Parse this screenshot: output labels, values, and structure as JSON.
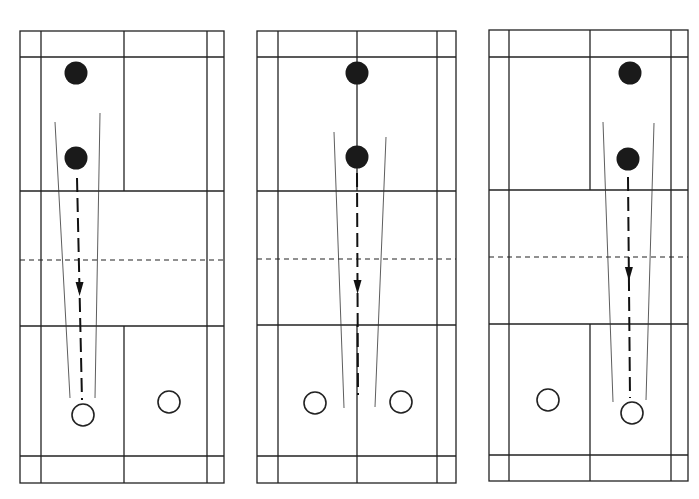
{
  "figure": {
    "colors": {
      "line": "#222222",
      "player_filled": "#1a1a1a",
      "background": "#ffffff"
    }
  },
  "courts": [
    {
      "id": "court-1",
      "bounds": {
        "left": 20,
        "right": 224,
        "top": 31,
        "bottom": 483
      },
      "inner_left": 41,
      "inner_right": 207,
      "center_x": 124,
      "long_service_top": 57,
      "short_service_top": 191,
      "net_y": 260,
      "short_service_bottom": 326,
      "long_service_bottom": 456,
      "center_line_top_only": true,
      "players_filled": [
        {
          "x": 76,
          "y": 73
        },
        {
          "x": 76,
          "y": 158
        }
      ],
      "players_open": [
        {
          "x": 83,
          "y": 415
        },
        {
          "x": 169,
          "y": 402
        }
      ],
      "shuttle_path": {
        "x1": 77,
        "y1": 178,
        "x2": 82,
        "y2": 400,
        "arrow_y": 292
      },
      "guides": [
        {
          "x1": 55,
          "y1": 122,
          "x2": 70,
          "y2": 398
        },
        {
          "x1": 100,
          "y1": 113,
          "x2": 95,
          "y2": 398
        }
      ]
    },
    {
      "id": "court-2",
      "bounds": {
        "left": 257,
        "right": 456,
        "top": 31,
        "bottom": 483
      },
      "inner_left": 278,
      "inner_right": 437,
      "center_x": 357,
      "long_service_top": 57,
      "short_service_top": 191,
      "net_y": 259,
      "short_service_bottom": 325,
      "long_service_bottom": 456,
      "players_filled": [
        {
          "x": 357,
          "y": 73
        },
        {
          "x": 357,
          "y": 157
        }
      ],
      "players_open": [
        {
          "x": 315,
          "y": 403
        },
        {
          "x": 401,
          "y": 402
        }
      ],
      "shuttle_path": {
        "x1": 357,
        "y1": 173,
        "x2": 358,
        "y2": 395,
        "arrow_y": 290
      },
      "guides": [
        {
          "x1": 334,
          "y1": 132,
          "x2": 344,
          "y2": 408
        },
        {
          "x1": 386,
          "y1": 137,
          "x2": 375,
          "y2": 407
        }
      ]
    },
    {
      "id": "court-3",
      "bounds": {
        "left": 489,
        "right": 688,
        "top": 30,
        "bottom": 481
      },
      "inner_left": 509,
      "inner_right": 671,
      "center_x": 590,
      "long_service_top": 57,
      "short_service_top": 190,
      "net_y": 257,
      "short_service_bottom": 324,
      "long_service_bottom": 455,
      "players_filled": [
        {
          "x": 630,
          "y": 73
        },
        {
          "x": 628,
          "y": 159
        }
      ],
      "players_open": [
        {
          "x": 548,
          "y": 400
        },
        {
          "x": 632,
          "y": 413
        }
      ],
      "shuttle_path": {
        "x1": 628,
        "y1": 177,
        "x2": 630,
        "y2": 398,
        "arrow_y": 277
      },
      "guides": [
        {
          "x1": 603,
          "y1": 122,
          "x2": 613,
          "y2": 402
        },
        {
          "x1": 654,
          "y1": 123,
          "x2": 646,
          "y2": 400
        }
      ]
    }
  ]
}
